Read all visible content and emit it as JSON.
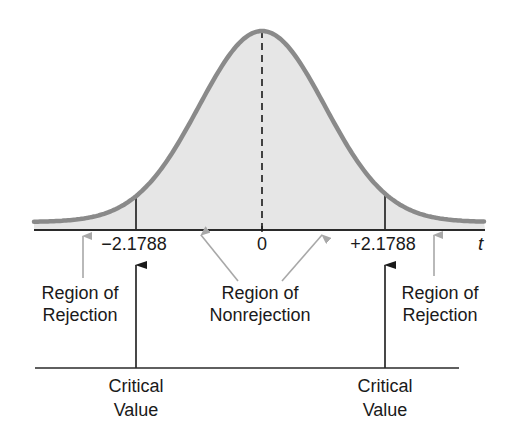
{
  "diagram": {
    "type": "two-tailed t-test rejection regions",
    "axis_variable": "t",
    "ticks": [
      {
        "label": "−2.1788",
        "value": -2.1788
      },
      {
        "label": "0",
        "value": 0
      },
      {
        "label": "+2.1788",
        "value": 2.1788
      }
    ],
    "regions": {
      "left_rejection": {
        "line1": "Region of",
        "line2": "Rejection"
      },
      "nonrejection": {
        "line1": "Region of",
        "line2": "Nonrejection"
      },
      "right_rejection": {
        "line1": "Region of",
        "line2": "Rejection"
      }
    },
    "critical_values": {
      "left": {
        "line1": "Critical",
        "line2": "Value"
      },
      "right": {
        "line1": "Critical",
        "line2": "Value"
      }
    },
    "colors": {
      "curve": "#8a8a8a",
      "fill": "#e6e6e6",
      "axis": "#2a2a2a",
      "arrow_gray": "#a8a8a8",
      "arrow_black": "#1a1a1a"
    }
  }
}
